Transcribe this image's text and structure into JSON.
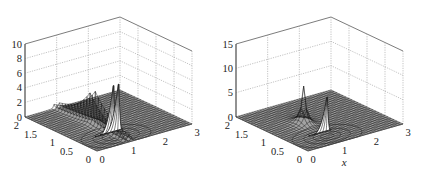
{
  "chart_data": [
    {
      "type": "surface",
      "title": "",
      "xlabel": "",
      "ylabel": "",
      "zlabel": "",
      "xlim": [
        0,
        3
      ],
      "ylim": [
        0,
        2
      ],
      "zlim": [
        0,
        10
      ],
      "x_ticks": [
        "0",
        "1",
        "2",
        "3"
      ],
      "y_ticks": [
        "0",
        "0.5",
        "1",
        "1.5",
        "2"
      ],
      "z_ticks": [
        "0",
        "2",
        "4",
        "6",
        "8",
        "10"
      ],
      "z_tick_values": [
        0,
        2,
        4,
        6,
        8,
        10
      ],
      "grid": true,
      "contours_on_base": true,
      "surface": {
        "description": "flat mesh near z=0 with a sharp twin-ridged peak",
        "peak_location": {
          "x": 1.0,
          "y": 1.0
        },
        "peak_height": 7,
        "twin_peaks": true
      }
    },
    {
      "type": "surface",
      "title": "",
      "xlabel": "x",
      "ylabel": "",
      "zlabel": "",
      "xlim": [
        0,
        3
      ],
      "ylim": [
        0,
        2
      ],
      "zlim": [
        0,
        15
      ],
      "x_ticks": [
        "0",
        "1",
        "2",
        "3"
      ],
      "y_ticks": [
        "0",
        "0.5",
        "1",
        "1.5",
        "2"
      ],
      "z_ticks": [
        "0",
        "5",
        "10",
        "15"
      ],
      "z_tick_values": [
        0,
        5,
        10,
        15
      ],
      "grid": true,
      "contours_on_base": true,
      "surface": {
        "description": "flat mesh near z=0 with a single sharp peak",
        "peak_location": {
          "x": 1.0,
          "y": 1.0
        },
        "peak_height": 8,
        "twin_peaks": false
      }
    }
  ]
}
